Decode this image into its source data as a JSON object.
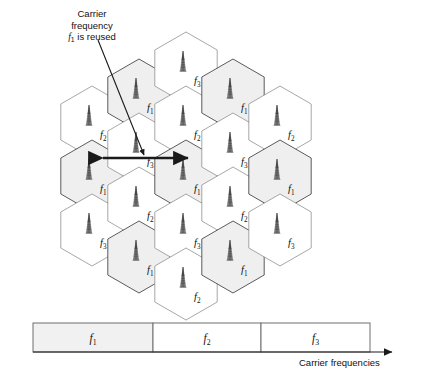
{
  "figure": {
    "annotation": {
      "line1": "Carrier",
      "line2": "frequency",
      "line3_prefix": "f",
      "line3_sub": "1",
      "line3_suffix": " is reused"
    },
    "axis_label": "Carrier frequencies",
    "reuse_arrow": {
      "label": "reuse-distance-arrow",
      "x_start": 95,
      "x_end": 196,
      "y": 158
    }
  },
  "colors": {
    "cell_shaded_fill": "#efefef",
    "cell_white_fill": "#ffffff",
    "cell_stroke": "#8a8a8a",
    "cell_stroke_dark": "#4a4a4a",
    "antenna": "#6b6b6b",
    "arrow": "#1a1a1a",
    "text": "#111111",
    "bar_fill_shaded": "#f1f1f1",
    "bar_fill_white": "#ffffff",
    "bar_stroke": "#6e6e6e"
  },
  "geometry": {
    "hex_radius": 36,
    "hex_half_width": 31.2,
    "col_x": [
      92,
      123,
      154,
      185,
      216
    ],
    "note": "pointy-top hexagons, columns offset vertically"
  },
  "grid": {
    "columns": [
      {
        "index": 0,
        "name": "hex-column-1",
        "cx": 92,
        "cells": [
          {
            "freq_prefix": "f",
            "freq_sub": "2",
            "shaded": false,
            "cy": 122
          },
          {
            "freq_prefix": "f",
            "freq_sub": "1",
            "shaded": true,
            "cy": 176
          },
          {
            "freq_prefix": "f",
            "freq_sub": "3",
            "shaded": false,
            "cy": 230
          }
        ]
      },
      {
        "index": 1,
        "name": "hex-column-2",
        "cx": 139,
        "cells": [
          {
            "freq_prefix": "f",
            "freq_sub": "1",
            "shaded": true,
            "cy": 95
          },
          {
            "freq_prefix": "f",
            "freq_sub": "3",
            "shaded": false,
            "cy": 149
          },
          {
            "freq_prefix": "f",
            "freq_sub": "2",
            "shaded": false,
            "cy": 203
          },
          {
            "freq_prefix": "f",
            "freq_sub": "1",
            "shaded": true,
            "cy": 257
          }
        ]
      },
      {
        "index": 2,
        "name": "hex-column-3",
        "cx": 186,
        "cells": [
          {
            "freq_prefix": "f",
            "freq_sub": "3",
            "shaded": false,
            "cy": 68
          },
          {
            "freq_prefix": "f",
            "freq_sub": "2",
            "shaded": false,
            "cy": 122
          },
          {
            "freq_prefix": "f",
            "freq_sub": "1",
            "shaded": true,
            "cy": 176
          },
          {
            "freq_prefix": "f",
            "freq_sub": "3",
            "shaded": false,
            "cy": 230
          },
          {
            "freq_prefix": "f",
            "freq_sub": "2",
            "shaded": false,
            "cy": 284
          }
        ]
      },
      {
        "index": 3,
        "name": "hex-column-4",
        "cx": 233,
        "cells": [
          {
            "freq_prefix": "f",
            "freq_sub": "1",
            "shaded": true,
            "cy": 95
          },
          {
            "freq_prefix": "f",
            "freq_sub": "3",
            "shaded": false,
            "cy": 149
          },
          {
            "freq_prefix": "f",
            "freq_sub": "2",
            "shaded": false,
            "cy": 203
          },
          {
            "freq_prefix": "f",
            "freq_sub": "1",
            "shaded": true,
            "cy": 257
          }
        ]
      },
      {
        "index": 4,
        "name": "hex-column-5",
        "cx": 280,
        "cells": [
          {
            "freq_prefix": "f",
            "freq_sub": "2",
            "shaded": false,
            "cy": 122
          },
          {
            "freq_prefix": "f",
            "freq_sub": "1",
            "shaded": true,
            "cy": 176
          },
          {
            "freq_prefix": "f",
            "freq_sub": "3",
            "shaded": false,
            "cy": 230
          }
        ]
      }
    ]
  },
  "spectrum_bar": {
    "name": "carrier-frequency-bar",
    "x": 33,
    "y": 323,
    "width": 337,
    "height": 29,
    "segments": [
      {
        "freq_prefix": "f",
        "freq_sub": "1",
        "x": 33,
        "width": 120,
        "shaded": true
      },
      {
        "freq_prefix": "f",
        "freq_sub": "2",
        "x": 153,
        "width": 108,
        "shaded": false
      },
      {
        "freq_prefix": "f",
        "freq_sub": "3",
        "x": 261,
        "width": 109,
        "shaded": false
      }
    ],
    "axis_arrow": {
      "x_start": 33,
      "x_end": 396,
      "y": 352
    }
  }
}
